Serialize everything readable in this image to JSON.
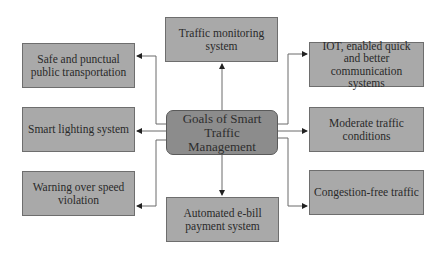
{
  "diagram": {
    "center": {
      "label": "Goals of Smart Traffic Management"
    },
    "top": {
      "label": "Traffic monitoring system"
    },
    "bottom": {
      "label": "Automated e-bill payment system"
    },
    "left": [
      {
        "label": "Safe and punctual public transportation"
      },
      {
        "label": "Smart lighting system"
      },
      {
        "label": "Warning over speed violation"
      }
    ],
    "right": [
      {
        "label": "IOT, enabled quick and better communication systems"
      },
      {
        "label": "Moderate traffic conditions"
      },
      {
        "label": "Congestion-free traffic"
      }
    ],
    "colors": {
      "box_fill": "#a9a9a9",
      "center_fill": "#8c8c8c",
      "line": "#555555"
    }
  }
}
